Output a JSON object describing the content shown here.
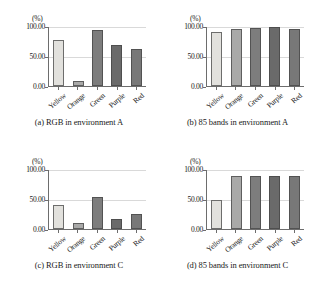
{
  "figure": {
    "unit_label": "(%)",
    "y_ticks": [
      "100.00",
      "50.00",
      "0.00"
    ],
    "categories": [
      "Yellow",
      "Orange",
      "Green",
      "Purple",
      "Red"
    ],
    "bar_colors": [
      "#e2e1dd",
      "#a9a9a8",
      "#7d7d7d",
      "#6a6a6a",
      "#787878"
    ],
    "panels": [
      {
        "id": "panel-a",
        "caption": "(a) RGB in environment A",
        "values": [
          77,
          8,
          93,
          68,
          61
        ]
      },
      {
        "id": "panel-b",
        "caption": "(b) 85 bands in environment A",
        "values": [
          90,
          95,
          96,
          98,
          95
        ]
      },
      {
        "id": "panel-c",
        "caption": "(c) RGB in environment C",
        "values": [
          40,
          10,
          54,
          16,
          25
        ]
      },
      {
        "id": "panel-d",
        "caption": "(d) 85 bands in environment C",
        "values": [
          49,
          88,
          88,
          88,
          88
        ]
      }
    ]
  },
  "chart_data": [
    {
      "type": "bar",
      "title": "(a) RGB in environment A",
      "categories": [
        "Yellow",
        "Orange",
        "Green",
        "Purple",
        "Red"
      ],
      "values": [
        77,
        8,
        93,
        68,
        61
      ],
      "xlabel": "",
      "ylabel": "(%)",
      "ylim": [
        0,
        100
      ],
      "yticks": [
        0,
        50,
        100
      ],
      "ytick_labels": [
        "0.00",
        "50.00",
        "100.00"
      ],
      "grid": true,
      "legend": "none"
    },
    {
      "type": "bar",
      "title": "(b) 85 bands in environment A",
      "categories": [
        "Yellow",
        "Orange",
        "Green",
        "Purple",
        "Red"
      ],
      "values": [
        90,
        95,
        96,
        98,
        95
      ],
      "xlabel": "",
      "ylabel": "(%)",
      "ylim": [
        0,
        100
      ],
      "yticks": [
        0,
        50,
        100
      ],
      "ytick_labels": [
        "0.00",
        "50.00",
        "100.00"
      ],
      "grid": true,
      "legend": "none"
    },
    {
      "type": "bar",
      "title": "(c) RGB in environment C",
      "categories": [
        "Yellow",
        "Orange",
        "Green",
        "Purple",
        "Red"
      ],
      "values": [
        40,
        10,
        54,
        16,
        25
      ],
      "xlabel": "",
      "ylabel": "(%)",
      "ylim": [
        0,
        100
      ],
      "yticks": [
        0,
        50,
        100
      ],
      "ytick_labels": [
        "0.00",
        "50.00",
        "100.00"
      ],
      "grid": true,
      "legend": "none"
    },
    {
      "type": "bar",
      "title": "(d) 85 bands in environment C",
      "categories": [
        "Yellow",
        "Orange",
        "Green",
        "Purple",
        "Red"
      ],
      "values": [
        49,
        88,
        88,
        88,
        88
      ],
      "xlabel": "",
      "ylabel": "(%)",
      "ylim": [
        0,
        100
      ],
      "yticks": [
        0,
        50,
        100
      ],
      "ytick_labels": [
        "0.00",
        "50.00",
        "100.00"
      ],
      "grid": true,
      "legend": "none"
    }
  ]
}
